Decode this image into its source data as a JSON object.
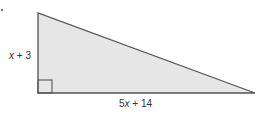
{
  "figure": {
    "type": "right-triangle",
    "fill_color": "#e6e6e6",
    "stroke_color": "#555555",
    "vertices": {
      "top": [
        38,
        13
      ],
      "right_angle": [
        38,
        93
      ],
      "right": [
        255,
        93
      ]
    },
    "labels": {
      "height": {
        "var": "x",
        "rest": " + 3"
      },
      "base": {
        "coef": "5",
        "var": "x",
        "rest": " + 14"
      }
    },
    "right_angle_marker": true
  }
}
